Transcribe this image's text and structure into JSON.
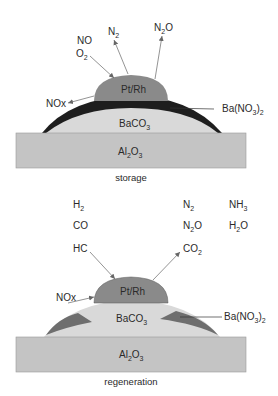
{
  "colors": {
    "substrate": "#c4c4c4",
    "baco3": "#d9d9d9",
    "ba_nitrate_storage": "#1e1e1e",
    "ba_nitrate_regen": "#6e6e6e",
    "pt_rh": "#8a8a8a",
    "arrow": "#666666",
    "text": "#2a2a2a"
  },
  "storage": {
    "caption": "storage",
    "catalyst": {
      "main": "Pt/Rh"
    },
    "support": {
      "main": "BaCO",
      "sub": "3"
    },
    "substrate": {
      "main": "Al",
      "sub1": "2",
      "mid": "O",
      "sub2": "3"
    },
    "nitrate": {
      "main": "Ba(NO",
      "sub1": "3",
      "close": ")",
      "sub2": "2"
    },
    "inputs": [
      {
        "main": "NO"
      },
      {
        "main": "O",
        "sub": "2"
      }
    ],
    "outputs": [
      {
        "main": "N",
        "sub": "2"
      },
      {
        "main": "N",
        "sub": "2",
        "tail": "O"
      }
    ],
    "released": {
      "main": "NOx"
    }
  },
  "regeneration": {
    "caption": "regeneration",
    "catalyst": {
      "main": "Pt/Rh"
    },
    "support": {
      "main": "BaCO",
      "sub": "3"
    },
    "substrate": {
      "main": "Al",
      "sub1": "2",
      "mid": "O",
      "sub2": "3"
    },
    "nitrate": {
      "main": "Ba(NO",
      "sub1": "3",
      "close": ")",
      "sub2": "2"
    },
    "reductants": [
      {
        "main": "H",
        "sub": "2"
      },
      {
        "main": "CO"
      },
      {
        "main": "HC"
      }
    ],
    "products_col1": [
      {
        "main": "N",
        "sub": "2"
      },
      {
        "main": "N",
        "sub": "2",
        "tail": "O"
      },
      {
        "main": "CO",
        "sub": "2"
      }
    ],
    "products_col2": [
      {
        "main": "NH",
        "sub": "3"
      },
      {
        "main": "H",
        "sub": "2",
        "tail": "O"
      }
    ],
    "incoming": {
      "main": "NOx"
    }
  }
}
